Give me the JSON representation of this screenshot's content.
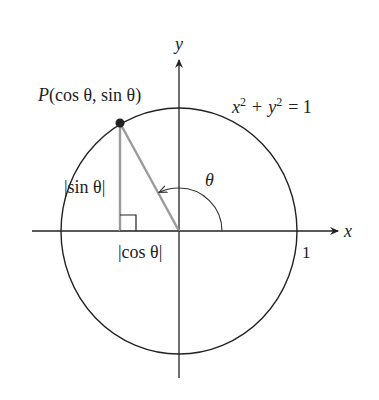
{
  "diagram": {
    "type": "unit-circle",
    "axes": {
      "x_label": "x",
      "y_label": "y"
    },
    "circle": {
      "equation_lhs_x": "x",
      "equation_lhs_y": "y",
      "equation_exp": "2",
      "equation_plus": "+",
      "equation_eq": "= 1",
      "radius_label": "1"
    },
    "point": {
      "name": "P",
      "coords": "(cos θ, sin θ)"
    },
    "angle_label": "θ",
    "sin_label": "|sin θ|",
    "cos_label": "|cos θ|",
    "colors": {
      "line": "#222222",
      "triangle": "#9a9a9a",
      "point": "#222222"
    }
  }
}
